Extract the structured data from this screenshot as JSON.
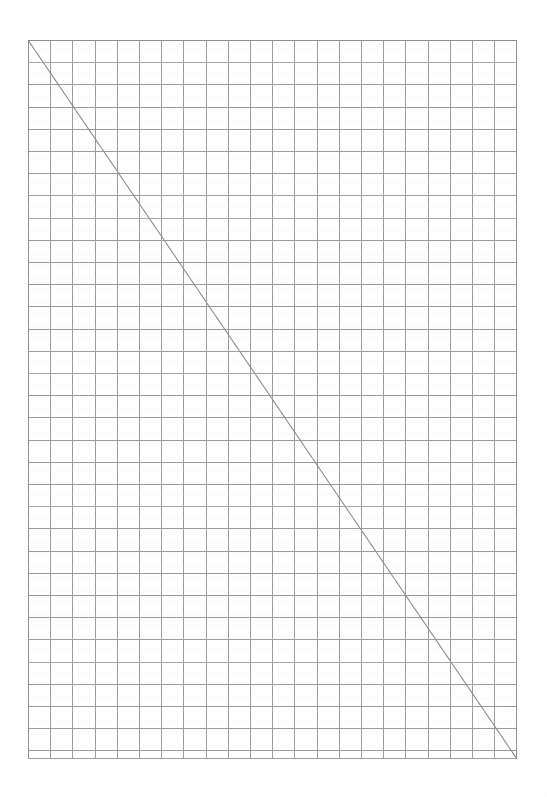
{
  "document": {
    "kind": "graph-paper-sheet",
    "title": "Blank quadrille graph paper with a single ruled diagonal",
    "page_width": 547,
    "page_height": 797,
    "background_color": "#ffffff"
  },
  "margins": {
    "left": 28,
    "top": 40,
    "right": 30,
    "bottom": 38
  },
  "grid": {
    "origin_x": 28,
    "origin_y": 40,
    "width": 489,
    "height": 719,
    "cell_size": 22.2,
    "columns": 22,
    "rows": 32,
    "line_color": "#9a9a9a",
    "line_color_strong": "#8e8e8e",
    "line_width": 1,
    "style": "uniform-single-weight"
  },
  "annotations": {
    "diagonal": {
      "name": "corner-to-corner-diagonal",
      "x1": 28,
      "y1": 40,
      "x2": 517,
      "y2": 759,
      "color": "#8c8c8c",
      "width": 1.1,
      "description": "Straight pencil line from the top-left grid corner to the bottom-right grid corner"
    }
  },
  "chart_data": {
    "type": "line",
    "xlabel": "",
    "ylabel": "",
    "grid": true,
    "legend": null,
    "xlim": [
      0,
      22
    ],
    "ylim": [
      0,
      32
    ],
    "xticks": [
      0,
      2,
      4,
      6,
      8,
      10,
      12,
      14,
      16,
      18,
      20,
      22
    ],
    "yticks": [
      0,
      4,
      8,
      12,
      16,
      20,
      24,
      28,
      32
    ],
    "xtick_labels": [],
    "ytick_labels": [],
    "series": [
      {
        "name": "diagonal",
        "x": [
          0,
          22
        ],
        "y": [
          32,
          0
        ],
        "color": "#8c8c8c"
      }
    ]
  }
}
